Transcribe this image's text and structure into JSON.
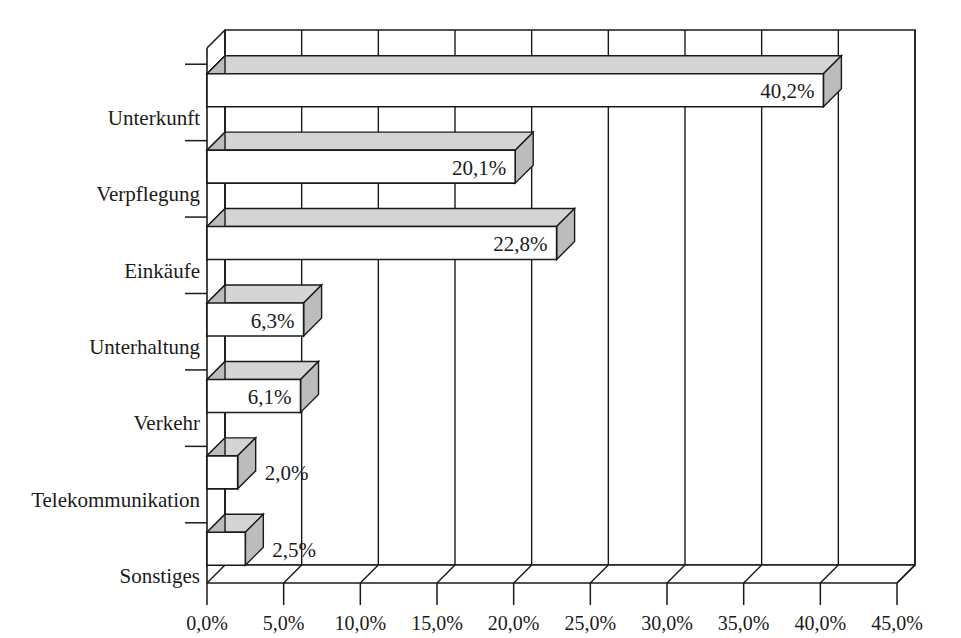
{
  "chart_data": {
    "type": "bar",
    "orientation": "horizontal",
    "style": "3d-bar",
    "title": "",
    "subtitle": "",
    "xlabel": "",
    "ylabel": "",
    "categories": [
      "Unterkunft",
      "Verpflegung",
      "Einkäufe",
      "Unterhaltung",
      "Verkehr",
      "Telekommunikation",
      "Sonstiges"
    ],
    "values": [
      40.2,
      20.1,
      22.8,
      6.3,
      6.1,
      2.0,
      2.5
    ],
    "value_labels": [
      "40,2%",
      "20,1%",
      "22,8%",
      "6,3%",
      "6,1%",
      "2,0%",
      "2,5%"
    ],
    "label_placement": [
      "inside",
      "inside",
      "inside",
      "inside",
      "inside",
      "outside",
      "outside"
    ],
    "xlim": [
      0,
      45
    ],
    "xticks": [
      0,
      5,
      10,
      15,
      20,
      25,
      30,
      35,
      40,
      45
    ],
    "xtick_labels": [
      "0,0%",
      "5,0%",
      "10,0%",
      "15,0%",
      "20,0%",
      "25,0%",
      "30,0%",
      "35,0%",
      "40,0%",
      "45,0%"
    ],
    "grid": {
      "vertical": true,
      "horizontal": false
    },
    "legend": {
      "visible": false,
      "position": "none",
      "entries": []
    },
    "decimal_separator": ",",
    "unit": "%"
  },
  "colors": {
    "background": "#ffffff",
    "bar_front": "#ffffff",
    "bar_top": "#d4d4d4",
    "bar_side": "#bcbcbc",
    "bar_outline": "#1a1a1a",
    "axis": "#1a1a1a",
    "gridline": "#1a1a1a",
    "text": "#1a1a1a"
  },
  "geometry": {
    "plot_left": 207,
    "plot_right": 897,
    "plot_top": 30,
    "plot_bottom": 583,
    "depth_x": 18,
    "depth_y": 18,
    "band_count": 7,
    "bar_thickness": 33
  }
}
